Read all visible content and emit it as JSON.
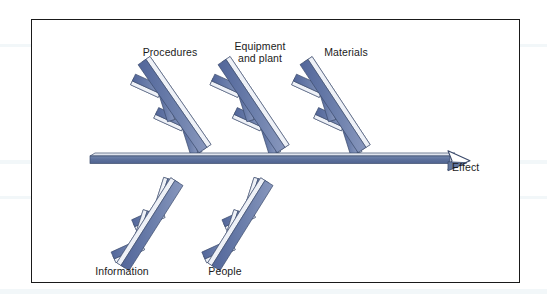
{
  "figure": {
    "type": "fishbone-ishikawa-diagram",
    "frame": {
      "border_color": "#1a1a1a",
      "background": "#ffffff"
    },
    "palette": {
      "bone_dark": "#5a6e9e",
      "bone_mid": "#7d8fb7",
      "bone_light": "#c9d2e4",
      "bone_highlight": "#eef1f7",
      "outline": "#3b4a6b",
      "spine_face": "#64789f",
      "spine_top": "#d7dde9",
      "text": "#1b1b1b"
    }
  },
  "spine": {
    "name": "main-spine",
    "arrowhead_fill": "#ffffff"
  },
  "effect": {
    "label": "Effect"
  },
  "chart_data": {
    "type": "diagram",
    "diagram_type": "fishbone",
    "title": "",
    "effect": "Effect",
    "categories_top": [
      "Procedures",
      "Equipment\nand plant",
      "Materials"
    ],
    "categories_bottom": [
      "Information",
      "People"
    ],
    "bones_per_category": 2
  },
  "categories": [
    {
      "id": "procedures",
      "label": "Procedures",
      "side": "top",
      "label_x": 101,
      "label_y": 27,
      "label_w": 74,
      "bone": {
        "x1": 171,
        "y1": 130,
        "x2": 110,
        "y2": 42
      },
      "subs": [
        {
          "t": 0.3,
          "dir": "up-left",
          "len": 30
        },
        {
          "t": 0.3,
          "dir": "down-right",
          "len": 32
        },
        {
          "t": 0.68,
          "dir": "up-left",
          "len": 30
        },
        {
          "t": 0.68,
          "dir": "down-right",
          "len": 32
        }
      ]
    },
    {
      "id": "equipment-and-plant",
      "label": "Equipment\nand plant",
      "side": "top",
      "label_x": 191,
      "label_y": 21,
      "label_w": 74,
      "bone": {
        "x1": 249,
        "y1": 130,
        "x2": 190,
        "y2": 42
      },
      "subs": [
        {
          "t": 0.3,
          "dir": "up-left",
          "len": 30
        },
        {
          "t": 0.3,
          "dir": "down-right",
          "len": 32
        },
        {
          "t": 0.68,
          "dir": "up-left",
          "len": 30
        },
        {
          "t": 0.68,
          "dir": "down-right",
          "len": 32
        }
      ]
    },
    {
      "id": "materials",
      "label": "Materials",
      "side": "top",
      "label_x": 277,
      "label_y": 27,
      "label_w": 74,
      "bone": {
        "x1": 330,
        "y1": 130,
        "x2": 272,
        "y2": 42
      },
      "subs": [
        {
          "t": 0.3,
          "dir": "up-left",
          "len": 30
        },
        {
          "t": 0.3,
          "dir": "down-right",
          "len": 32
        },
        {
          "t": 0.68,
          "dir": "up-left",
          "len": 30
        },
        {
          "t": 0.68,
          "dir": "down-right",
          "len": 32
        }
      ]
    },
    {
      "id": "information",
      "label": "Information",
      "side": "bottom",
      "label_x": 49,
      "label_y": 246,
      "label_w": 82,
      "bone": {
        "x1": 147,
        "y1": 163,
        "x2": 93,
        "y2": 248
      },
      "subs": [
        {
          "t": 0.32,
          "dir": "down-left",
          "len": 31
        },
        {
          "t": 0.32,
          "dir": "up-right",
          "len": 32
        },
        {
          "t": 0.7,
          "dir": "down-left",
          "len": 31
        },
        {
          "t": 0.7,
          "dir": "up-right",
          "len": 32
        }
      ]
    },
    {
      "id": "people",
      "label": "People",
      "side": "bottom",
      "label_x": 155,
      "label_y": 246,
      "label_w": 76,
      "bone": {
        "x1": 237,
        "y1": 163,
        "x2": 184,
        "y2": 248
      },
      "subs": [
        {
          "t": 0.32,
          "dir": "down-left",
          "len": 31
        },
        {
          "t": 0.32,
          "dir": "up-right",
          "len": 32
        },
        {
          "t": 0.7,
          "dir": "down-left",
          "len": 31
        },
        {
          "t": 0.7,
          "dir": "up-right",
          "len": 32
        }
      ]
    }
  ],
  "scan_bands": [
    {
      "top": 44,
      "height": 3
    },
    {
      "top": 160,
      "height": 4
    },
    {
      "top": 196,
      "height": 3
    },
    {
      "top": 289,
      "height": 5
    }
  ]
}
